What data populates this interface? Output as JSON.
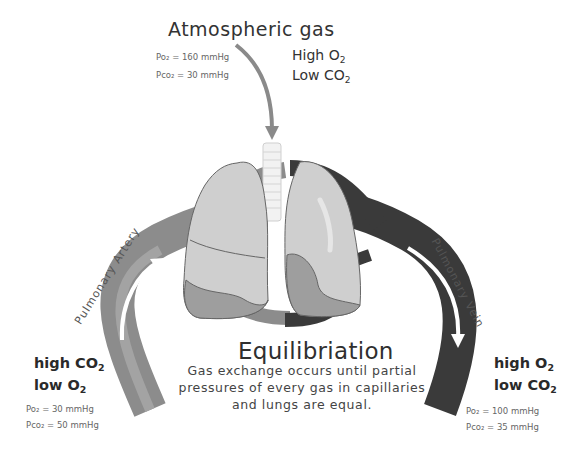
{
  "title": "Atmospheric gas",
  "atmosphere": {
    "po2": "Po₂ = 160 mmHg",
    "pco2": "Pco₂ = 30 mmHg",
    "o2_line": {
      "level": "High",
      "gas": "O",
      "sub": "2"
    },
    "co2_line": {
      "level": "Low",
      "gas": "CO",
      "sub": "2"
    }
  },
  "artery": {
    "label": "Pulmonary Artery",
    "co2_line": {
      "level": "high",
      "gas": "CO",
      "sub": "2"
    },
    "o2_line": {
      "level": "low",
      "gas": "O",
      "sub": "2"
    },
    "po2": "Po₂ = 30 mmHg",
    "pco2": "Pco₂ = 50 mmHg",
    "color": "#8c8c8c"
  },
  "vein": {
    "label": "Pulmonary Vein",
    "o2_line": {
      "level": "high",
      "gas": "O",
      "sub": "2"
    },
    "co2_line": {
      "level": "low",
      "gas": "CO",
      "sub": "2"
    },
    "po2": "Po₂ = 100 mmHg",
    "pco2": "Pco₂ = 35 mmHg",
    "color": "#3a3a3a"
  },
  "equilibration": {
    "heading": "Equilibriation",
    "description": "Gas exchange occurs until partial pressures of every gas in capillaries and lungs are equal."
  },
  "colors": {
    "lung_fill": "#cfcfcf",
    "lung_lower": "#9e9e9e",
    "arrow": "#8a8a8a",
    "trachea": "#f2f2f2"
  }
}
